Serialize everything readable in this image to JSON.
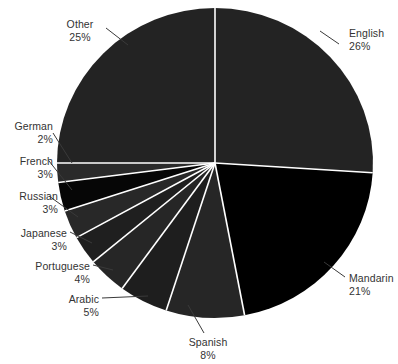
{
  "chart_data": {
    "type": "pie",
    "title": "",
    "subtitle": "",
    "xlabel": "",
    "ylabel": "",
    "legend_position": "none",
    "grid": false,
    "start_angle_deg": 0,
    "direction": "clockwise",
    "units": "percent",
    "categories": [
      "English",
      "Mandarin",
      "Spanish",
      "Arabic",
      "Portuguese",
      "Japanese",
      "Russian",
      "French",
      "German",
      "Other"
    ],
    "values": [
      26,
      21,
      8,
      5,
      4,
      3,
      3,
      3,
      2,
      25
    ],
    "slices": [
      {
        "label": "English",
        "value": 26,
        "value_text": "26%",
        "color": "#232323",
        "label_align": "left",
        "label_x": 349,
        "label_y": 27,
        "leader": [
          [
            339,
            44
          ],
          [
            320,
            31
          ]
        ]
      },
      {
        "label": "Mandarin",
        "value": 21,
        "value_text": "21%",
        "color": "#000000",
        "label_align": "left",
        "label_x": 349,
        "label_y": 272,
        "leader": [
          [
            345,
            277
          ],
          [
            324,
            262
          ]
        ]
      },
      {
        "label": "Spanish",
        "value": 8,
        "value_text": "8%",
        "color": "#262626",
        "label_align": "center",
        "label_x": 208,
        "label_y": 336,
        "leader": [
          [
            204,
            333
          ],
          [
            188,
            305
          ]
        ]
      },
      {
        "label": "Arabic",
        "value": 5,
        "value_text": "5%",
        "color": "#1e1e1e",
        "label_align": "right",
        "label_x": 99,
        "label_y": 293,
        "leader": [
          [
            102,
            298
          ],
          [
            148,
            296
          ]
        ]
      },
      {
        "label": "Portuguese",
        "value": 4,
        "value_text": "4%",
        "color": "#262626",
        "label_align": "right",
        "label_x": 90,
        "label_y": 260,
        "leader": [
          [
            93,
            265
          ],
          [
            113,
            270
          ]
        ]
      },
      {
        "label": "Japanese",
        "value": 3,
        "value_text": "3%",
        "color": "#1f1f1f",
        "label_align": "right",
        "label_x": 67,
        "label_y": 227,
        "leader": [
          [
            70,
            232
          ],
          [
            92,
            243
          ]
        ]
      },
      {
        "label": "Russian",
        "value": 3,
        "value_text": "3%",
        "color": "#282828",
        "label_align": "right",
        "label_x": 58,
        "label_y": 190,
        "leader": [
          [
            49,
            196
          ],
          [
            78,
            217
          ]
        ]
      },
      {
        "label": "French",
        "value": 3,
        "value_text": "3%",
        "color": "#060606",
        "label_align": "right",
        "label_x": 53,
        "label_y": 155,
        "leader": [
          [
            49,
            161
          ],
          [
            72,
            190
          ]
        ]
      },
      {
        "label": "German",
        "value": 2,
        "value_text": "2%",
        "color": "#2a2a2a",
        "label_align": "right",
        "label_x": 53,
        "label_y": 120,
        "leader": [
          [
            53,
            133
          ],
          [
            72,
            163
          ]
        ]
      },
      {
        "label": "Other",
        "value": 25,
        "value_text": "25%",
        "color": "#232323",
        "label_align": "center",
        "label_x": 80,
        "label_y": 18,
        "leader": [
          [
            106,
            28
          ],
          [
            128,
            45
          ]
        ]
      }
    ],
    "geometry": {
      "center_x": 215,
      "center_y": 163,
      "radius_x": 158,
      "radius_y": 155
    },
    "style": {
      "separator_color": "#ffffff",
      "separator_width": 1.6,
      "label_color": "#333333",
      "leader_color": "#3a3a3a",
      "background": "#ffffff"
    }
  }
}
